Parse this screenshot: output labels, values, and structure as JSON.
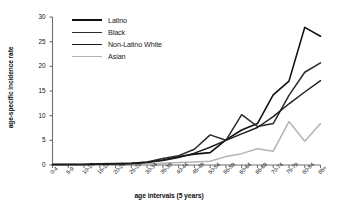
{
  "chart_data": {
    "type": "line",
    "title": "",
    "xlabel": "age intervals (5 years)",
    "ylabel": "age-specific incidence rate",
    "categories": [
      "0-4",
      "5-9",
      "10-14",
      "15-19",
      "20-24",
      "25-29",
      "30-34",
      "35-39",
      "40-44",
      "45-49",
      "50-54",
      "55-59",
      "60-64",
      "65-69",
      "70-74",
      "75-79",
      "80-84",
      "85+"
    ],
    "ylim": [
      0,
      30
    ],
    "yticks": [
      0,
      5,
      10,
      15,
      20,
      25,
      30
    ],
    "ytick_labels": [
      "0",
      "5",
      "10",
      "15",
      "20",
      "25",
      "30"
    ],
    "grid": false,
    "legend_position": "upper-left-inside",
    "series": [
      {
        "name": "Latino",
        "color": "#111111",
        "width": 1.6,
        "values": [
          0.1,
          0.1,
          0.1,
          0.15,
          0.2,
          0.25,
          0.5,
          1.0,
          1.7,
          2.2,
          2.5,
          5.1,
          7.1,
          8.4,
          14.2,
          17.0,
          27.9,
          26.1
        ]
      },
      {
        "name": "Black",
        "color": "#2a2a2a",
        "width": 1.5,
        "values": [
          0.1,
          0.1,
          0.12,
          0.2,
          0.25,
          0.35,
          0.6,
          1.3,
          1.9,
          3.2,
          6.1,
          5.0,
          10.2,
          7.8,
          8.4,
          14.1,
          18.8,
          20.7
        ]
      },
      {
        "name": "Non-Latino White",
        "color": "#1d1d1d",
        "width": 1.4,
        "values": [
          0.1,
          0.1,
          0.12,
          0.25,
          0.3,
          0.35,
          0.55,
          0.9,
          1.5,
          2.4,
          3.6,
          5.0,
          6.3,
          7.6,
          9.8,
          12.4,
          14.8,
          17.1
        ]
      },
      {
        "name": "Asian",
        "color": "#b4b4b4",
        "width": 1.5,
        "values": [
          0.05,
          0.05,
          0.07,
          0.1,
          0.12,
          0.15,
          0.2,
          0.35,
          0.5,
          0.6,
          0.75,
          1.7,
          2.3,
          3.3,
          2.8,
          8.8,
          4.8,
          8.4
        ]
      }
    ]
  },
  "legend": {
    "items": [
      {
        "label": "Latino"
      },
      {
        "label": "Black"
      },
      {
        "label": "Non-Latino White"
      },
      {
        "label": "Asian"
      }
    ]
  }
}
